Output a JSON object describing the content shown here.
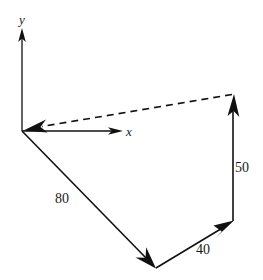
{
  "figure": {
    "type": "vector-polygon-diagram",
    "background_color": "#ffffff",
    "ink_color": "#111111",
    "axes": {
      "origin": {
        "x": 22,
        "y": 131
      },
      "y_axis": {
        "label": "y",
        "label_pos": {
          "x": 23,
          "y": 22
        },
        "from": {
          "x": 22,
          "y": 131
        },
        "to": {
          "x": 22,
          "y": 30
        },
        "arrow": "up"
      },
      "x_axis": {
        "label": "x",
        "label_pos": {
          "x": 129,
          "y": 135
        },
        "from": {
          "x": 22,
          "y": 131
        },
        "to": {
          "x": 122,
          "y": 131
        },
        "arrow": "right"
      }
    },
    "vectors": [
      {
        "name": "vector-80",
        "label": "80",
        "label_pos": {
          "x": 64,
          "y": 202
        },
        "from": {
          "x": 22,
          "y": 131
        },
        "to": {
          "x": 155,
          "y": 267
        },
        "style": "solid",
        "arrow_at": "to"
      },
      {
        "name": "vector-40",
        "label": "40",
        "label_pos": {
          "x": 204,
          "y": 253
        },
        "from": {
          "x": 155,
          "y": 267
        },
        "to": {
          "x": 233,
          "y": 220
        },
        "style": "solid",
        "arrow_at": "to"
      },
      {
        "name": "vector-50",
        "label": "50",
        "label_pos": {
          "x": 240,
          "y": 170
        },
        "from": {
          "x": 233,
          "y": 220
        },
        "to": {
          "x": 233,
          "y": 95
        },
        "style": "solid",
        "arrow_at": "to"
      },
      {
        "name": "resultant-vector",
        "label": "",
        "label_pos": null,
        "from": {
          "x": 233,
          "y": 95
        },
        "to": {
          "x": 24,
          "y": 130
        },
        "style": "dashed",
        "arrow_at": "to"
      }
    ],
    "labels": {
      "y_axis_label": "y",
      "x_axis_label": "x",
      "magnitude_80": "80",
      "magnitude_40": "40",
      "magnitude_50": "50"
    }
  }
}
